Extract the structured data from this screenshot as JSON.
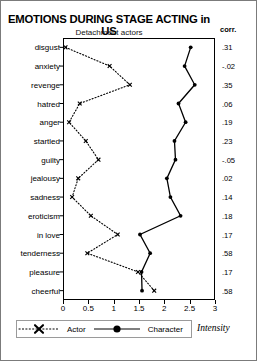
{
  "header": {
    "title": "EMOTIONS DURING STAGE ACTING in US",
    "subtitle": "Detachment actors",
    "corr_header": "corr."
  },
  "legend": {
    "actor_label": "Actor",
    "character_label": "Character",
    "axis_note": "Intensity"
  },
  "chart_data": {
    "type": "line",
    "title": "EMOTIONS DURING STAGE ACTING in US",
    "subtitle": "Detachment actors",
    "xlabel": "Intensity",
    "ylabel": "",
    "xlim": [
      0,
      3
    ],
    "xticks": [
      "0",
      "0.5",
      "1",
      "1.5",
      "2",
      "2.5",
      "3"
    ],
    "xtick_values": [
      0,
      0.5,
      1,
      1.5,
      2,
      2.5,
      3
    ],
    "grid": false,
    "orientation": "horizontal",
    "legend_position": "bottom-left",
    "categories": [
      "disgust",
      "anxiety",
      "revenge",
      "hatred",
      "anger",
      "startled",
      "guilty",
      "jealousy",
      "sadness",
      "eroticism",
      "in love",
      "tenderness",
      "pleasure",
      "cheerful"
    ],
    "series": [
      {
        "name": "Actor",
        "marker": "x",
        "linestyle": "dotted",
        "color": "#000000",
        "values": [
          0.05,
          0.92,
          1.32,
          0.33,
          0.12,
          0.45,
          0.7,
          0.3,
          0.18,
          0.55,
          1.08,
          0.48,
          1.48,
          1.8
        ]
      },
      {
        "name": "Character",
        "marker": "circle",
        "linestyle": "solid",
        "color": "#000000",
        "values": [
          2.52,
          2.4,
          2.6,
          2.28,
          2.42,
          2.2,
          2.22,
          2.05,
          2.12,
          2.32,
          1.52,
          1.72,
          1.55,
          1.56
        ]
      }
    ],
    "corr": [
      ".31",
      "-.02",
      ".35",
      ".06",
      ".19",
      ".23",
      "-.05",
      ".02",
      ".14",
      ".18",
      ".17",
      ".58",
      ".17",
      ".58"
    ],
    "corr_values": [
      0.31,
      -0.02,
      0.35,
      0.06,
      0.19,
      0.23,
      -0.05,
      0.02,
      0.14,
      0.18,
      0.17,
      0.58,
      0.17,
      0.58
    ]
  }
}
